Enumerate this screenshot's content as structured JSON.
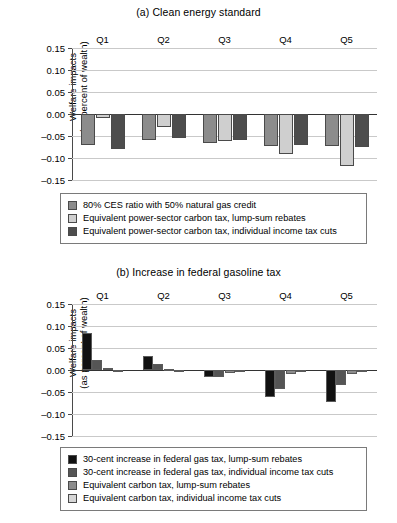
{
  "figure": {
    "ylabel_line1": "Welfare impacts",
    "ylabel_line2": "(as percent of wealth)"
  },
  "chart_data": [
    {
      "type": "bar",
      "id": "panel-a",
      "title": "(a) Clean energy standard",
      "xlabel": "",
      "ylabel": "Welfare impacts (as percent of wealth)",
      "categories": [
        "Q1",
        "Q2",
        "Q3",
        "Q4",
        "Q5"
      ],
      "ylim": [
        -0.15,
        0.15
      ],
      "yticks": [
        0.15,
        0.1,
        0.05,
        0.0,
        -0.05,
        -0.1,
        -0.15
      ],
      "ytick_labels": [
        "0.15",
        "0.10",
        "0.05",
        "0.00",
        "–0.05",
        "–0.10",
        "–0.15"
      ],
      "grid": true,
      "legend_position": "below",
      "series": [
        {
          "name": "80% CES ratio with 50% natural gas credit",
          "color": "#8c8c8c",
          "values": [
            -0.07,
            -0.06,
            -0.065,
            -0.073,
            -0.073
          ]
        },
        {
          "name": "Equivalent power-sector carbon tax, lump-sum rebates",
          "color": "#cfcfcf",
          "values": [
            -0.008,
            -0.03,
            -0.062,
            -0.09,
            -0.119
          ]
        },
        {
          "name": "Equivalent power-sector carbon tax, individual income tax cuts",
          "color": "#4d4d4d",
          "values": [
            -0.08,
            -0.055,
            -0.06,
            -0.07,
            -0.074
          ]
        }
      ]
    },
    {
      "type": "bar",
      "id": "panel-b",
      "title": "(b) Increase in federal gasoline tax",
      "xlabel": "",
      "ylabel": "Welfare impacts (as percent of wealth)",
      "categories": [
        "Q1",
        "Q2",
        "Q3",
        "Q4",
        "Q5"
      ],
      "ylim": [
        -0.15,
        0.15
      ],
      "yticks": [
        0.15,
        0.1,
        0.05,
        0.0,
        -0.05,
        -0.1,
        -0.15
      ],
      "ytick_labels": [
        "0.15",
        "0.10",
        "0.05",
        "0.00",
        "–0.05",
        "–0.10",
        "–0.15"
      ],
      "grid": true,
      "legend_position": "below",
      "series": [
        {
          "name": "30-cent increase in federal gas tax, lump-sum rebates",
          "color": "#111111",
          "values": [
            0.084,
            0.032,
            -0.015,
            -0.062,
            -0.073
          ]
        },
        {
          "name": "30-cent increase in federal gas tax, individual income tax cuts",
          "color": "#555555",
          "values": [
            0.022,
            0.013,
            -0.017,
            -0.044,
            -0.033
          ]
        },
        {
          "name": "Equivalent carbon tax, lump-sum rebates",
          "color": "#8c8c8c",
          "values": [
            0.005,
            0.002,
            -0.007,
            -0.01,
            -0.008
          ]
        },
        {
          "name": "Equivalent carbon tax, individual income tax cuts",
          "color": "#d6d6d6",
          "values": [
            -0.003,
            -0.003,
            -0.003,
            -0.005,
            -0.005
          ]
        }
      ]
    }
  ]
}
